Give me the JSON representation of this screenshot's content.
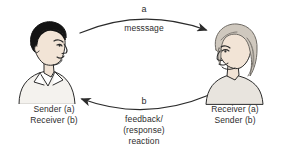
{
  "diagram": {
    "background_color": "#ffffff",
    "line_color": "#2b2b2b",
    "text_color": "#2d2d2d",
    "nodes": [
      {
        "id": "sender",
        "icon": "man-portrait-facing-right",
        "label_line1": "Sender (a)",
        "label_line2": "Receiver (b)",
        "hair_color": "#1a1a1a",
        "skin_color": "#f0e2d4",
        "shirt_color": "#f2f0ec"
      },
      {
        "id": "receiver",
        "icon": "woman-portrait-facing-left",
        "label_line1": "Receiver (a)",
        "label_line2": "Sender (b)",
        "hair_color": "#c9c2b8",
        "skin_color": "#f0e2d4",
        "shirt_color": "#e6e2dc"
      }
    ],
    "arrows": [
      {
        "id": "message-arrow",
        "direction": "left-to-right",
        "curve": "convex-up",
        "letter": "a",
        "caption_lines": [
          "messsage"
        ]
      },
      {
        "id": "feedback-arrow",
        "direction": "right-to-left",
        "curve": "convex-down",
        "letter": "b",
        "caption_lines": [
          "feedback/",
          "(response)",
          "reaction"
        ]
      }
    ]
  }
}
